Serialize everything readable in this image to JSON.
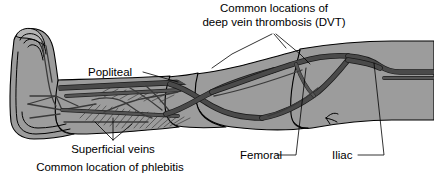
{
  "figure": {
    "background_color": "#ffffff",
    "limb_fill_color": "#9c9c9c",
    "vessel_color": "#4a4a4a",
    "outline_color": "#000000",
    "label_color": "#000000"
  },
  "labels": {
    "dvt": {
      "line1": "Common locations of",
      "line2": "deep vein thrombosis (DVT)"
    },
    "popliteal": "Popliteal",
    "superficial": {
      "line1": "Superficial veins",
      "line2": "Common location of phlebitis"
    },
    "femoral": "Femoral",
    "iliac": "Iliac"
  },
  "anatomy": {
    "regions": [
      "foot",
      "ankle",
      "calf",
      "knee",
      "thigh",
      "hip"
    ],
    "vessels": [
      "popliteal vein",
      "femoral vein",
      "iliac vein",
      "superficial veins",
      "deep veins"
    ]
  }
}
